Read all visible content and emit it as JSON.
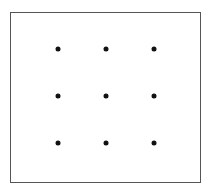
{
  "diagram": {
    "type": "dot-grid",
    "rows": 3,
    "cols": 3,
    "frame": {
      "border_color": "#555555",
      "background": "#ffffff"
    },
    "dot_color": "#111111",
    "dots": [
      {
        "row": 1,
        "col": 1,
        "x": 58,
        "y": 49
      },
      {
        "row": 1,
        "col": 2,
        "x": 106,
        "y": 49
      },
      {
        "row": 1,
        "col": 3,
        "x": 154,
        "y": 49
      },
      {
        "row": 2,
        "col": 1,
        "x": 58,
        "y": 96
      },
      {
        "row": 2,
        "col": 2,
        "x": 106,
        "y": 96
      },
      {
        "row": 2,
        "col": 3,
        "x": 154,
        "y": 96
      },
      {
        "row": 3,
        "col": 1,
        "x": 58,
        "y": 143
      },
      {
        "row": 3,
        "col": 2,
        "x": 106,
        "y": 143
      },
      {
        "row": 3,
        "col": 3,
        "x": 154,
        "y": 143
      }
    ]
  }
}
